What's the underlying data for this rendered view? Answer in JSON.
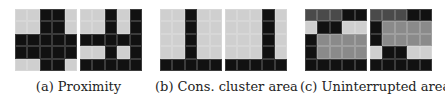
{
  "colors": {
    "L": "#cfcfcf",
    "D": "#111111",
    "M": "#8a8a8a",
    "G": "#4a4a4a"
  },
  "panels": [
    {
      "caption": "(a) Proximity",
      "grids": [
        [
          [
            "L",
            "L",
            "D",
            "D",
            "L"
          ],
          [
            "L",
            "L",
            "D",
            "D",
            "L"
          ],
          [
            "D",
            "D",
            "D",
            "D",
            "D"
          ],
          [
            "D",
            "D",
            "D",
            "D",
            "D"
          ],
          [
            "L",
            "L",
            "D",
            "D",
            "L"
          ]
        ],
        [
          [
            "L",
            "L",
            "D",
            "L",
            "D"
          ],
          [
            "L",
            "L",
            "D",
            "L",
            "D"
          ],
          [
            "D",
            "D",
            "D",
            "D",
            "D"
          ],
          [
            "L",
            "L",
            "D",
            "L",
            "D"
          ],
          [
            "D",
            "D",
            "D",
            "D",
            "D"
          ]
        ]
      ]
    },
    {
      "caption": "(b) Cons. cluster area",
      "grids": [
        [
          [
            "L",
            "L",
            "D",
            "L",
            "L"
          ],
          [
            "L",
            "L",
            "D",
            "L",
            "L"
          ],
          [
            "L",
            "L",
            "D",
            "L",
            "L"
          ],
          [
            "L",
            "L",
            "D",
            "L",
            "L"
          ],
          [
            "D",
            "D",
            "D",
            "D",
            "D"
          ]
        ],
        [
          [
            "L",
            "L",
            "L",
            "D",
            "L"
          ],
          [
            "L",
            "L",
            "L",
            "D",
            "L"
          ],
          [
            "L",
            "L",
            "L",
            "D",
            "L"
          ],
          [
            "L",
            "L",
            "L",
            "D",
            "L"
          ],
          [
            "D",
            "D",
            "D",
            "D",
            "D"
          ]
        ]
      ]
    },
    {
      "caption": "(c) Uninterrupted area",
      "grids": [
        [
          [
            "G",
            "G",
            "G",
            "D",
            "D"
          ],
          [
            "L",
            "D",
            "D",
            "L",
            "L"
          ],
          [
            "D",
            "M",
            "M",
            "M",
            "M"
          ],
          [
            "D",
            "M",
            "M",
            "M",
            "M"
          ],
          [
            "D",
            "D",
            "D",
            "D",
            "D"
          ]
        ],
        [
          [
            "G",
            "G",
            "G",
            "D",
            "D"
          ],
          [
            "D",
            "M",
            "M",
            "M",
            "M"
          ],
          [
            "D",
            "M",
            "M",
            "M",
            "M"
          ],
          [
            "L",
            "D",
            "D",
            "L",
            "L"
          ],
          [
            "D",
            "D",
            "D",
            "D",
            "D"
          ]
        ]
      ]
    }
  ]
}
